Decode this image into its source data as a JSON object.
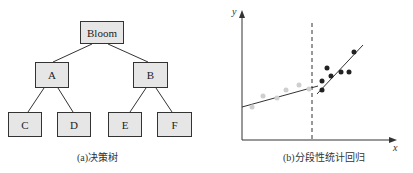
{
  "tree": {
    "root": "Bloom",
    "level1": [
      "A",
      "B"
    ],
    "level2": [
      "C",
      "D",
      "E",
      "F"
    ],
    "caption": "(a)决策树"
  },
  "regression": {
    "y_label": "y",
    "x_label": "x",
    "caption": "(b)分段性统计回归"
  }
}
